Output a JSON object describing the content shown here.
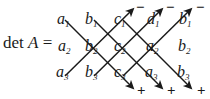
{
  "figure": {
    "name": "rule-of-sarrus-determinant-diagram",
    "expression_prefix": "det A =",
    "det_word": "det",
    "matrix_letter": "A",
    "equals": "=",
    "ink_color": "#1a1a1a",
    "background_color": "#ffffff"
  },
  "grid": {
    "rows": 3,
    "columns": 5,
    "entries": [
      [
        {
          "base": "a",
          "sub": "1",
          "text": "a1"
        },
        {
          "base": "b",
          "sub": "1",
          "text": "b1"
        },
        {
          "base": "c",
          "sub": "1",
          "text": "c1"
        },
        {
          "base": "d",
          "sub": "1",
          "text": "d1"
        },
        {
          "base": "b",
          "sub": "1",
          "text": "b1"
        }
      ],
      [
        {
          "base": "a",
          "sub": "2",
          "text": "a2"
        },
        {
          "base": "b",
          "sub": "2",
          "text": "b2"
        },
        {
          "base": "c",
          "sub": "2",
          "text": "c2"
        },
        {
          "base": "a",
          "sub": "2",
          "text": "a2"
        },
        {
          "base": "b",
          "sub": "2",
          "text": "b2"
        }
      ],
      [
        {
          "base": "a",
          "sub": "3",
          "text": "a3"
        },
        {
          "base": "b",
          "sub": "3",
          "text": "b3"
        },
        {
          "base": "c",
          "sub": "3",
          "text": "c3"
        },
        {
          "base": "a",
          "sub": "3",
          "text": "a3"
        },
        {
          "base": "b",
          "sub": "3",
          "text": "b3"
        }
      ]
    ]
  },
  "signs": {
    "top_label": "minus",
    "bottom_label": "plus",
    "minus_glyph": "−",
    "plus_glyph": "+",
    "top_signs": [
      "−",
      "−",
      "−"
    ],
    "bottom_signs": [
      "+",
      "+",
      "+"
    ]
  },
  "diagonals": {
    "descending_count": 3,
    "ascending_count": 3,
    "descending_sign": "+",
    "ascending_sign": "−"
  }
}
